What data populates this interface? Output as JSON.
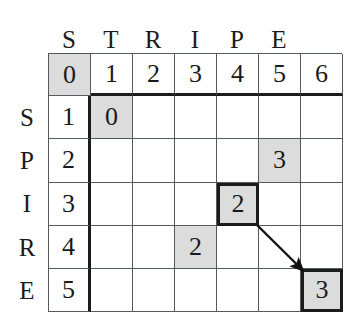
{
  "figure": {
    "grid_line_color": "#555a5e",
    "bold_line_color": "#1c1c1c",
    "shade_color": "#dcdcdc",
    "background_color": "#ffffff"
  },
  "column_header_letters": [
    "S",
    "T",
    "R",
    "I",
    "P",
    "E"
  ],
  "row_header_letters": [
    "S",
    "P",
    "I",
    "R",
    "E"
  ],
  "index_row": [
    "0",
    "1",
    "2",
    "3",
    "4",
    "5",
    "6"
  ],
  "row_indices": [
    "1",
    "2",
    "3",
    "4",
    "5"
  ],
  "table": {
    "rows": [
      {
        "index": "0",
        "index_shaded": true,
        "is_header": true,
        "cells": [
          {
            "value": "1",
            "shaded": false,
            "boxed": false
          },
          {
            "value": "2",
            "shaded": false,
            "boxed": false
          },
          {
            "value": "3",
            "shaded": false,
            "boxed": false
          },
          {
            "value": "4",
            "shaded": false,
            "boxed": false
          },
          {
            "value": "5",
            "shaded": false,
            "boxed": false
          },
          {
            "value": "6",
            "shaded": false,
            "boxed": false
          }
        ]
      },
      {
        "index": "1",
        "index_shaded": false,
        "is_header": false,
        "cells": [
          {
            "value": "0",
            "shaded": true,
            "boxed": false
          },
          {
            "value": "",
            "shaded": false,
            "boxed": false
          },
          {
            "value": "",
            "shaded": false,
            "boxed": false
          },
          {
            "value": "",
            "shaded": false,
            "boxed": false
          },
          {
            "value": "",
            "shaded": false,
            "boxed": false
          },
          {
            "value": "",
            "shaded": false,
            "boxed": false
          }
        ]
      },
      {
        "index": "2",
        "index_shaded": false,
        "is_header": false,
        "cells": [
          {
            "value": "",
            "shaded": false,
            "boxed": false
          },
          {
            "value": "",
            "shaded": false,
            "boxed": false
          },
          {
            "value": "",
            "shaded": false,
            "boxed": false
          },
          {
            "value": "",
            "shaded": false,
            "boxed": false
          },
          {
            "value": "3",
            "shaded": true,
            "boxed": false
          },
          {
            "value": "",
            "shaded": false,
            "boxed": false
          }
        ]
      },
      {
        "index": "3",
        "index_shaded": false,
        "is_header": false,
        "cells": [
          {
            "value": "",
            "shaded": false,
            "boxed": false
          },
          {
            "value": "",
            "shaded": false,
            "boxed": false
          },
          {
            "value": "",
            "shaded": false,
            "boxed": false
          },
          {
            "value": "2",
            "shaded": true,
            "boxed": true
          },
          {
            "value": "",
            "shaded": false,
            "boxed": false
          },
          {
            "value": "",
            "shaded": false,
            "boxed": false
          }
        ]
      },
      {
        "index": "4",
        "index_shaded": false,
        "is_header": false,
        "cells": [
          {
            "value": "",
            "shaded": false,
            "boxed": false
          },
          {
            "value": "",
            "shaded": false,
            "boxed": false
          },
          {
            "value": "2",
            "shaded": true,
            "boxed": false
          },
          {
            "value": "",
            "shaded": false,
            "boxed": false
          },
          {
            "value": "",
            "shaded": false,
            "boxed": false
          },
          {
            "value": "",
            "shaded": false,
            "boxed": false
          }
        ]
      },
      {
        "index": "5",
        "index_shaded": false,
        "is_header": false,
        "cells": [
          {
            "value": "",
            "shaded": false,
            "boxed": false
          },
          {
            "value": "",
            "shaded": false,
            "boxed": false
          },
          {
            "value": "",
            "shaded": false,
            "boxed": false
          },
          {
            "value": "",
            "shaded": false,
            "boxed": false
          },
          {
            "value": "",
            "shaded": false,
            "boxed": false
          },
          {
            "value": "3",
            "shaded": true,
            "boxed": true
          }
        ]
      }
    ]
  },
  "annotations": {
    "arrow": {
      "name": "diagonal-traceback-arrow",
      "from_cell": {
        "row_index": "3",
        "column_index": "4",
        "value": "2"
      },
      "to_cell": {
        "row_index": "5",
        "column_index": "6",
        "value": "3"
      },
      "color": "#101010"
    }
  }
}
